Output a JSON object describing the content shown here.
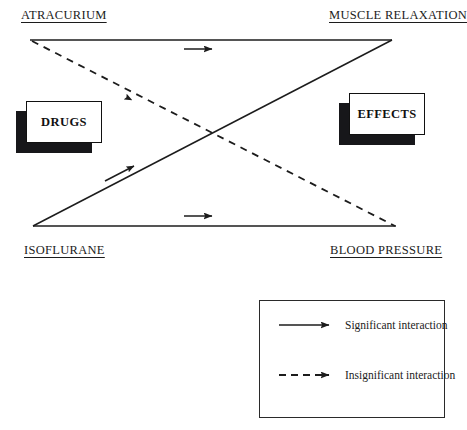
{
  "diagram": {
    "nodes": [
      {
        "id": "atracurium",
        "label": "ATRACURIUM",
        "position": "top-left",
        "underlined": true
      },
      {
        "id": "muscle",
        "label": "MUSCLE RELAXATION",
        "position": "top-right",
        "underlined": true
      },
      {
        "id": "isoflurane",
        "label": "ISOFLURANE",
        "position": "bottom-left",
        "underlined": true
      },
      {
        "id": "bloodpressure",
        "label": "BLOOD PRESSURE",
        "position": "bottom-right",
        "underlined": true
      }
    ],
    "group_boxes": [
      {
        "id": "drugs",
        "label": "DRUGS",
        "side": "left"
      },
      {
        "id": "effects",
        "label": "EFFECTS",
        "side": "right"
      }
    ],
    "edges": [
      {
        "id": "atracurium-to-muscle",
        "from": "ATRACURIUM",
        "to": "MUSCLE RELAXATION",
        "style": "solid",
        "arrow": "right"
      },
      {
        "id": "isoflurane-to-bloodpressure",
        "from": "ISOFLURANE",
        "to": "BLOOD PRESSURE",
        "style": "solid",
        "arrow": "right"
      },
      {
        "id": "isoflurane-to-muscle",
        "from": "ISOFLURANE",
        "to": "MUSCLE RELAXATION",
        "style": "solid",
        "arrow": "up-right"
      },
      {
        "id": "atracurium-to-bloodpressure",
        "from": "ATRACURIUM",
        "to": "BLOOD PRESSURE",
        "style": "dashed",
        "arrow": "down-right"
      }
    ],
    "colors": {
      "line": "#1c1c1c",
      "box_fill": "#ffffff",
      "box_border": "#111111",
      "box_shadow": "#17171a",
      "text": "#1c1c1c",
      "background": "#ffffff"
    }
  },
  "legend": {
    "items": [
      {
        "id": "significant",
        "style": "solid",
        "label": "Significant interaction"
      },
      {
        "id": "insignificant",
        "style": "dashed",
        "label": "Insignificant interaction"
      }
    ]
  }
}
